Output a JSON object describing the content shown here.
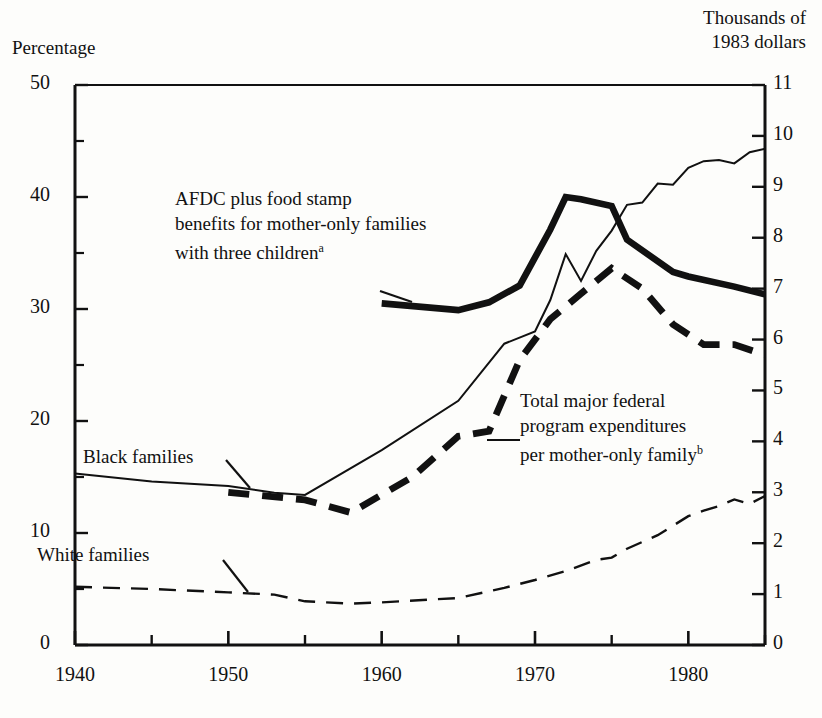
{
  "chart_data": {
    "type": "line",
    "title": "",
    "xlabel": "",
    "ylabel_left": "Percentage",
    "ylabel_right": "Thousands of\n1983 dollars",
    "xlim": [
      1940,
      1985
    ],
    "ylim_left": [
      0,
      50
    ],
    "ylim_right": [
      0,
      11
    ],
    "grid": false,
    "legend_position": "inline-annotations",
    "x_ticks_major": [
      1940,
      1950,
      1960,
      1970,
      1980
    ],
    "x_ticks_minor": [
      1945,
      1955,
      1965,
      1975,
      1985
    ],
    "x_tick_labels": [
      "1940",
      "1950",
      "1960",
      "1970",
      "1980"
    ],
    "y_ticks_left_major": [
      0,
      10,
      20,
      30,
      40,
      50
    ],
    "y_ticks_left_minor": [
      5,
      15,
      25,
      35,
      45
    ],
    "y_tick_labels_left": [
      "0",
      "10",
      "20",
      "30",
      "40",
      "50"
    ],
    "y_ticks_right": [
      0,
      1,
      2,
      3,
      4,
      5,
      6,
      7,
      8,
      9,
      10,
      11
    ],
    "y_tick_labels_right": [
      "0",
      "1",
      "2",
      "3",
      "4",
      "5",
      "6",
      "7",
      "8",
      "9",
      "10",
      "11"
    ],
    "series": [
      {
        "name": "Black families",
        "axis": "left",
        "style": "thin-solid",
        "label": "Black families",
        "x": [
          1940,
          1945,
          1950,
          1953,
          1955,
          1960,
          1965,
          1968,
          1970,
          1971,
          1972,
          1973,
          1974,
          1975,
          1976,
          1977,
          1978,
          1979,
          1980,
          1981,
          1982,
          1983,
          1984,
          1985
        ],
        "values": [
          15.3,
          14.6,
          14.2,
          13.6,
          13.4,
          17.4,
          21.8,
          26.9,
          28.0,
          30.8,
          34.9,
          32.5,
          35.2,
          37.0,
          39.3,
          39.5,
          41.2,
          41.1,
          42.6,
          43.2,
          43.3,
          43.0,
          44.0,
          44.3
        ]
      },
      {
        "name": "White families",
        "axis": "left",
        "style": "thin-dashed",
        "label": "White families",
        "x": [
          1940,
          1945,
          1950,
          1953,
          1955,
          1958,
          1960,
          1965,
          1968,
          1970,
          1972,
          1974,
          1975,
          1976,
          1978,
          1980,
          1981,
          1982,
          1983,
          1984,
          1985
        ],
        "values": [
          5.2,
          5.0,
          4.7,
          4.5,
          3.9,
          3.7,
          3.8,
          4.2,
          5.1,
          5.8,
          6.6,
          7.6,
          7.8,
          8.6,
          9.8,
          11.5,
          12.0,
          12.4,
          13.0,
          12.6,
          13.3
        ]
      },
      {
        "name": "AFDC plus food stamp benefits for mother-only families with three children",
        "axis": "left",
        "style": "thick-solid",
        "label": "AFDC plus food stamp\nbenefits for mother-only families\nwith three children",
        "footnote": "a",
        "x": [
          1960,
          1965,
          1967,
          1969,
          1971,
          1972,
          1973,
          1975,
          1976,
          1979,
          1980,
          1983,
          1985
        ],
        "values": [
          30.5,
          29.9,
          30.6,
          32.1,
          37.1,
          40.0,
          39.8,
          39.2,
          36.2,
          33.3,
          32.9,
          32.0,
          31.3
        ]
      },
      {
        "name": "Total major federal program expenditures per mother-only family",
        "axis": "right",
        "style": "thick-dashed",
        "label": "Total major federal\nprogram expenditures\nper mother-only family",
        "footnote": "b",
        "x": [
          1950,
          1955,
          1958,
          1962,
          1965,
          1967,
          1969,
          1971,
          1973,
          1975,
          1977,
          1979,
          1981,
          1983,
          1985
        ],
        "values": [
          3.0,
          2.85,
          2.6,
          3.3,
          4.1,
          4.2,
          5.6,
          6.4,
          6.9,
          7.4,
          7.0,
          6.3,
          5.9,
          5.9,
          5.7
        ]
      }
    ],
    "annotations": [
      {
        "id": "afdc",
        "lines": [
          "AFDC plus food stamp",
          "benefits for mother-only families",
          "with three children"
        ],
        "footnote": "a"
      },
      {
        "id": "total",
        "lines": [
          "Total major federal",
          "program expenditures",
          "per mother-only family"
        ],
        "footnote": "b"
      }
    ],
    "inline_labels": [
      "Black families",
      "White families"
    ],
    "colors": {
      "ink": "#111111",
      "background": "#fdfdfb"
    }
  }
}
